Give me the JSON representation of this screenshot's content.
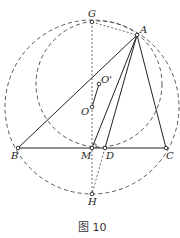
{
  "figure": {
    "caption": "图 10",
    "points": {
      "G": {
        "label": "G",
        "x": 92,
        "y": 22
      },
      "A": {
        "label": "A",
        "x": 137,
        "y": 35
      },
      "O1": {
        "label": "O'",
        "x": 99,
        "y": 84
      },
      "O": {
        "label": "O",
        "x": 92,
        "y": 107
      },
      "B": {
        "label": "B",
        "x": 18,
        "y": 148
      },
      "M": {
        "label": "M",
        "x": 92,
        "y": 148
      },
      "D": {
        "label": "D",
        "x": 105,
        "y": 148
      },
      "C": {
        "label": "C",
        "x": 166,
        "y": 148
      },
      "H": {
        "label": "H",
        "x": 92,
        "y": 194
      }
    },
    "circles": [
      {
        "name": "circumcircle-O",
        "cx": 92,
        "cy": 107,
        "r": 87,
        "style": "dashed"
      },
      {
        "name": "circle-O-prime",
        "cx": 99,
        "cy": 84,
        "r": 63,
        "style": "dashed"
      }
    ],
    "colors": {
      "line": "#222222",
      "dashed": "#444444",
      "background": "#ffffff"
    }
  }
}
